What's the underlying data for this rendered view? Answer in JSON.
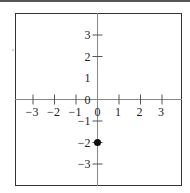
{
  "chart_data": {
    "type": "scatter",
    "title": "",
    "xlabel": "",
    "ylabel": "",
    "xlim": [
      -4,
      4
    ],
    "ylim": [
      -4,
      4
    ],
    "grid": false,
    "x_ticks": [
      -3,
      -2,
      -1,
      0,
      1,
      2,
      3
    ],
    "x_tick_labels": [
      "−3",
      "−2",
      "−1",
      "0",
      "1",
      "2",
      "3"
    ],
    "y_ticks": [
      3,
      2,
      1,
      0,
      -1,
      -2,
      -3
    ],
    "y_tick_labels": [
      "3",
      "2",
      "1",
      "0",
      "−1",
      "−2",
      "−3"
    ],
    "points": [
      {
        "x": 0,
        "y": -2
      }
    ],
    "colors": {
      "axis": "#888888",
      "frame": "#333333",
      "point": "#111111"
    }
  }
}
